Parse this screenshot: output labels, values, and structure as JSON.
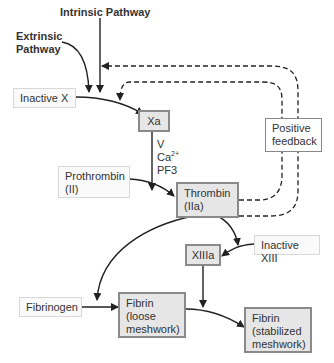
{
  "title_labels": {
    "intrinsic": "Intrinsic Pathway",
    "extrinsic_line1": "Extrinsic",
    "extrinsic_line2": "Pathway"
  },
  "nodes": {
    "inactive_x": "Inactive X",
    "xa": "Xa",
    "cofactors": {
      "v": "V",
      "ca": "Ca",
      "ca_sup": "2+",
      "pf3": "PF3"
    },
    "positive_feedback_line1": "Positive",
    "positive_feedback_line2": "feedback",
    "prothrombin_line1": "Prothrombin",
    "prothrombin_line2": "(II)",
    "thrombin_line1": "Thrombin",
    "thrombin_line2": "(IIa)",
    "inactive_xiii": "Inactive XIII",
    "xiiia": "XIIIa",
    "fibrinogen": "Fibrinogen",
    "fibrin_loose_line1": "Fibrin",
    "fibrin_loose_line2": "(loose",
    "fibrin_loose_line3": "meshwork)",
    "fibrin_stable_line1": "Fibrin",
    "fibrin_stable_line2": "(stabilized",
    "fibrin_stable_line3": "meshwork)"
  },
  "colors": {
    "arrow": "#222222",
    "light_box_bg": "#fafafa",
    "dark_box_bg": "#e6e6e6",
    "dark_box_border": "#8a8a8a"
  }
}
